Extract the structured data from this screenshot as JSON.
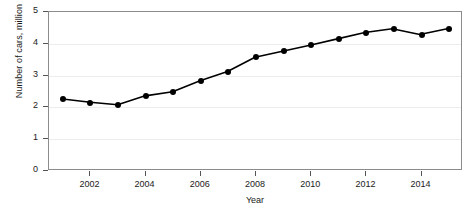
{
  "chart_data": {
    "type": "line",
    "title": "",
    "xlabel": "Year",
    "ylabel": "Number of cars, million",
    "x": [
      2001,
      2002,
      2003,
      2004,
      2005,
      2006,
      2007,
      2008,
      2009,
      2010,
      2011,
      2012,
      2013,
      2014,
      2015
    ],
    "values": [
      2.25,
      2.15,
      2.07,
      2.35,
      2.48,
      2.83,
      3.12,
      3.57,
      3.76,
      3.95,
      4.15,
      4.35,
      4.47,
      4.29,
      4.47
    ],
    "series": [
      {
        "name": "Number of cars",
        "values": [
          2.25,
          2.15,
          2.07,
          2.35,
          2.48,
          2.83,
          3.12,
          3.57,
          3.76,
          3.95,
          4.15,
          4.35,
          4.47,
          4.29,
          4.47
        ]
      }
    ],
    "xlim": [
      2000.5,
      2015.5
    ],
    "ylim": [
      0,
      5
    ],
    "yticks": [
      "0",
      "1",
      "2",
      "3",
      "4",
      "5"
    ],
    "xticks": [
      "2002",
      "2004",
      "2006",
      "2008",
      "2010",
      "2012",
      "2014"
    ],
    "grid": "horizontal",
    "legend": "none",
    "line_color": "#000000",
    "marker_color": "#000000",
    "grid_color": "#ededed",
    "frame_color": "#8c8c8c",
    "background": "#ffffff"
  }
}
